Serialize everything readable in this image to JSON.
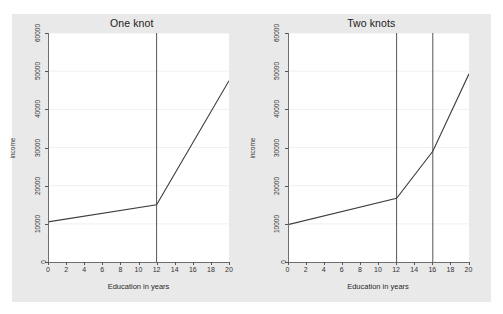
{
  "figure": {
    "background_color": "#e9e9e9",
    "panel_background_color": "#ffffff",
    "line_color": "#3d3d3d",
    "knot_line_color": "#55555a",
    "grid_color": "#f0f0f0"
  },
  "chart_data": [
    {
      "type": "line",
      "title": "One knot",
      "xlabel": "Education in years",
      "ylabel": "income",
      "xlim": [
        0,
        20
      ],
      "ylim": [
        0,
        60000
      ],
      "xticks": [
        0,
        2,
        4,
        6,
        8,
        10,
        12,
        14,
        16,
        18,
        20
      ],
      "xtick_labels": [
        "0",
        "2",
        "4",
        "6",
        "8",
        "10",
        "12",
        "14",
        "16",
        "18",
        "20"
      ],
      "yticks": [
        0,
        10000,
        20000,
        30000,
        40000,
        50000,
        60000
      ],
      "ytick_labels": [
        "0",
        "10000",
        "20000",
        "30000",
        "40000",
        "50000",
        "60000"
      ],
      "grid": true,
      "legend": "none",
      "knots": [
        12
      ],
      "series": [
        {
          "name": "fitted spline",
          "x": [
            0,
            12,
            20
          ],
          "values": [
            10500,
            15000,
            47500
          ]
        }
      ]
    },
    {
      "type": "line",
      "title": "Two knots",
      "xlabel": "Education in years",
      "ylabel": "income",
      "xlim": [
        0,
        20
      ],
      "ylim": [
        0,
        60000
      ],
      "xticks": [
        0,
        2,
        4,
        6,
        8,
        10,
        12,
        14,
        16,
        18,
        20
      ],
      "xtick_labels": [
        "0",
        "2",
        "4",
        "6",
        "8",
        "10",
        "12",
        "14",
        "16",
        "18",
        "20"
      ],
      "yticks": [
        0,
        10000,
        20000,
        30000,
        40000,
        50000,
        60000
      ],
      "ytick_labels": [
        "0",
        "10000",
        "20000",
        "30000",
        "40000",
        "50000",
        "60000"
      ],
      "grid": true,
      "legend": "none",
      "knots": [
        12,
        16
      ],
      "series": [
        {
          "name": "fitted spline",
          "x": [
            0,
            12,
            16,
            20
          ],
          "values": [
            9800,
            16700,
            29000,
            49300
          ]
        }
      ]
    }
  ]
}
